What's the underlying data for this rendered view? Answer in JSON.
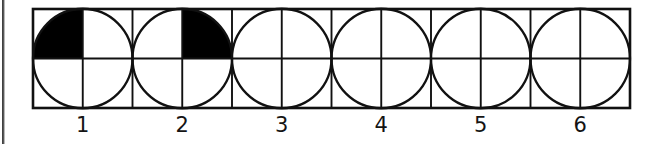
{
  "figure": {
    "colors": {
      "ink": "#111111",
      "shade_fill": "#000000",
      "paper": "#ffffff",
      "scan_edge": "#2b2b2b"
    },
    "frame": {
      "x": 33,
      "y": 9,
      "width": 597,
      "height": 99,
      "stroke_width": 2.6,
      "columns": 12,
      "rows": 2,
      "inner_stroke_width": 1.9
    },
    "circle_count": 6,
    "quadrant_names": [
      "top-left",
      "top-right",
      "bottom-right",
      "bottom-left"
    ],
    "circles": [
      {
        "index": 1,
        "label": "1",
        "shaded_quadrants": [
          "top-left"
        ],
        "shaded_count": 1,
        "total_parts": 4,
        "fraction": "1/4"
      },
      {
        "index": 2,
        "label": "2",
        "shaded_quadrants": [
          "top-right"
        ],
        "shaded_count": 1,
        "total_parts": 4,
        "fraction": "1/4"
      },
      {
        "index": 3,
        "label": "3",
        "shaded_quadrants": [],
        "shaded_count": 0,
        "total_parts": 4,
        "fraction": "0/4"
      },
      {
        "index": 4,
        "label": "4",
        "shaded_quadrants": [],
        "shaded_count": 0,
        "total_parts": 4,
        "fraction": "0/4"
      },
      {
        "index": 5,
        "label": "5",
        "shaded_quadrants": [],
        "shaded_count": 0,
        "total_parts": 4,
        "fraction": "0/4"
      },
      {
        "index": 6,
        "label": "6",
        "shaded_quadrants": [],
        "shaded_count": 0,
        "total_parts": 4,
        "fraction": "0/4"
      }
    ],
    "labels": [
      "1",
      "2",
      "3",
      "4",
      "5",
      "6"
    ]
  }
}
